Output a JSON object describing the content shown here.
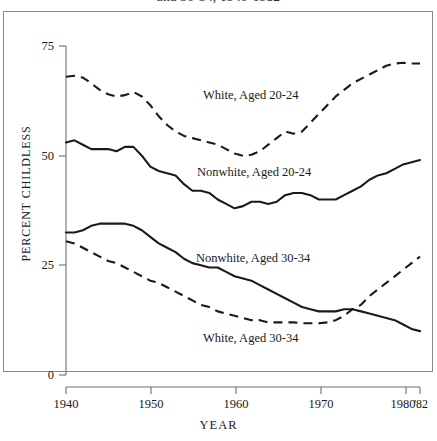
{
  "figure": {
    "title_visible_fragment": "and 30-34, 1940-1982",
    "axis_title_y": "PERCENT CHILDLESS",
    "axis_title_x": "YEAR"
  },
  "y_ticks": [
    {
      "label": "75",
      "value": 75
    },
    {
      "label": "50",
      "value": 50
    },
    {
      "label": "25",
      "value": 25
    },
    {
      "label": "0",
      "value": 0
    }
  ],
  "x_ticks": [
    {
      "label": "1940",
      "value": 1940
    },
    {
      "label": "1950",
      "value": 1950
    },
    {
      "label": "1960",
      "value": 1960
    },
    {
      "label": "1970",
      "value": 1970
    },
    {
      "label": "1980",
      "value": 1980
    },
    {
      "label": "'82",
      "value": 1982
    }
  ],
  "series_labels": {
    "white_20_24": "White, Aged 20-24",
    "nonwhite_20_24": "Nonwhite, Aged 20-24",
    "nonwhite_30_34": "Nonwhite, Aged 30-34",
    "white_30_34": "White, Aged 30-34"
  },
  "colors": {
    "ink": "#1a1a1a",
    "frame": "#8a8a8a",
    "axis": "#6f6f6f",
    "background": "#ffffff"
  },
  "chart_data": {
    "type": "line",
    "title": "and 30-34, 1940-1982",
    "xlabel": "YEAR",
    "ylabel": "PERCENT CHILDLESS",
    "xlim": [
      1940,
      1982
    ],
    "ylim": [
      0,
      75
    ],
    "yticks": [
      0,
      25,
      50,
      75
    ],
    "xticks": [
      1940,
      1950,
      1960,
      1970,
      1980,
      1982
    ],
    "grid": false,
    "legend": "inline-annotations",
    "series": [
      {
        "name": "White, Aged 20-24",
        "style": "dashed",
        "x": [
          1940,
          1941,
          1942,
          1943,
          1944,
          1945,
          1946,
          1947,
          1948,
          1949,
          1950,
          1951,
          1952,
          1953,
          1954,
          1955,
          1956,
          1957,
          1958,
          1959,
          1960,
          1961,
          1962,
          1963,
          1964,
          1965,
          1966,
          1967,
          1968,
          1969,
          1970,
          1971,
          1972,
          1973,
          1974,
          1975,
          1976,
          1977,
          1978,
          1979,
          1980,
          1981,
          1982
        ],
        "y": [
          68.0,
          68.2,
          67.8,
          66.5,
          65.0,
          64.0,
          63.5,
          63.8,
          64.5,
          63.5,
          61.5,
          59.0,
          57.0,
          55.5,
          54.5,
          54.0,
          53.5,
          53.0,
          52.5,
          51.5,
          50.5,
          50.0,
          50.2,
          51.0,
          52.5,
          54.0,
          55.5,
          55.0,
          55.5,
          57.5,
          59.5,
          61.5,
          63.5,
          65.0,
          66.5,
          67.5,
          68.5,
          69.5,
          70.5,
          71.0,
          71.2,
          71.0,
          71.0
        ]
      },
      {
        "name": "Nonwhite, Aged 20-24",
        "style": "solid",
        "x": [
          1940,
          1941,
          1942,
          1943,
          1944,
          1945,
          1946,
          1947,
          1948,
          1949,
          1950,
          1951,
          1952,
          1953,
          1954,
          1955,
          1956,
          1957,
          1958,
          1959,
          1960,
          1961,
          1962,
          1963,
          1964,
          1965,
          1966,
          1967,
          1968,
          1969,
          1970,
          1971,
          1972,
          1973,
          1974,
          1975,
          1976,
          1977,
          1978,
          1979,
          1980,
          1981,
          1982
        ],
        "y": [
          53.0,
          53.5,
          52.5,
          51.5,
          51.5,
          51.5,
          51.0,
          52.0,
          52.0,
          50.0,
          47.5,
          46.5,
          46.0,
          45.5,
          43.5,
          42.0,
          42.0,
          41.5,
          40.0,
          39.0,
          38.0,
          38.5,
          39.5,
          39.5,
          39.0,
          39.5,
          41.0,
          41.5,
          41.5,
          41.0,
          40.0,
          40.0,
          40.0,
          41.0,
          42.0,
          43.0,
          44.5,
          45.5,
          46.0,
          47.0,
          48.0,
          48.5,
          49.0
        ]
      },
      {
        "name": "Nonwhite, Aged 30-34",
        "style": "solid",
        "x": [
          1940,
          1941,
          1942,
          1943,
          1944,
          1945,
          1946,
          1947,
          1948,
          1949,
          1950,
          1951,
          1952,
          1953,
          1954,
          1955,
          1956,
          1957,
          1958,
          1959,
          1960,
          1961,
          1962,
          1963,
          1964,
          1965,
          1966,
          1967,
          1968,
          1969,
          1970,
          1971,
          1972,
          1973,
          1974,
          1975,
          1976,
          1977,
          1978,
          1979,
          1980,
          1981,
          1982
        ],
        "y": [
          32.5,
          32.5,
          33.0,
          34.0,
          34.5,
          34.5,
          34.5,
          34.5,
          34.0,
          33.0,
          31.5,
          30.0,
          29.0,
          28.0,
          26.5,
          25.5,
          25.0,
          24.5,
          24.5,
          23.5,
          22.5,
          22.0,
          21.5,
          20.5,
          19.5,
          18.5,
          17.5,
          16.5,
          15.5,
          15.0,
          14.5,
          14.5,
          14.5,
          15.0,
          15.0,
          14.5,
          14.0,
          13.5,
          13.0,
          12.5,
          11.5,
          10.5,
          10.0
        ]
      },
      {
        "name": "White, Aged 30-34",
        "style": "dashed",
        "x": [
          1940,
          1941,
          1942,
          1943,
          1944,
          1945,
          1946,
          1947,
          1948,
          1949,
          1950,
          1951,
          1952,
          1953,
          1954,
          1955,
          1956,
          1957,
          1958,
          1959,
          1960,
          1961,
          1962,
          1963,
          1964,
          1965,
          1966,
          1967,
          1968,
          1969,
          1970,
          1971,
          1972,
          1973,
          1974,
          1975,
          1976,
          1977,
          1978,
          1979,
          1980,
          1981,
          1982
        ],
        "y": [
          30.5,
          30.0,
          29.0,
          28.0,
          27.0,
          26.0,
          25.5,
          24.5,
          23.5,
          22.5,
          21.5,
          21.0,
          20.0,
          19.0,
          18.0,
          17.0,
          16.0,
          15.5,
          14.5,
          14.0,
          13.5,
          13.0,
          12.5,
          12.5,
          12.0,
          12.0,
          12.0,
          12.0,
          11.8,
          11.8,
          11.8,
          12.0,
          12.5,
          13.5,
          15.0,
          16.0,
          18.0,
          19.5,
          21.0,
          22.5,
          24.0,
          25.5,
          27.0
        ]
      }
    ]
  }
}
